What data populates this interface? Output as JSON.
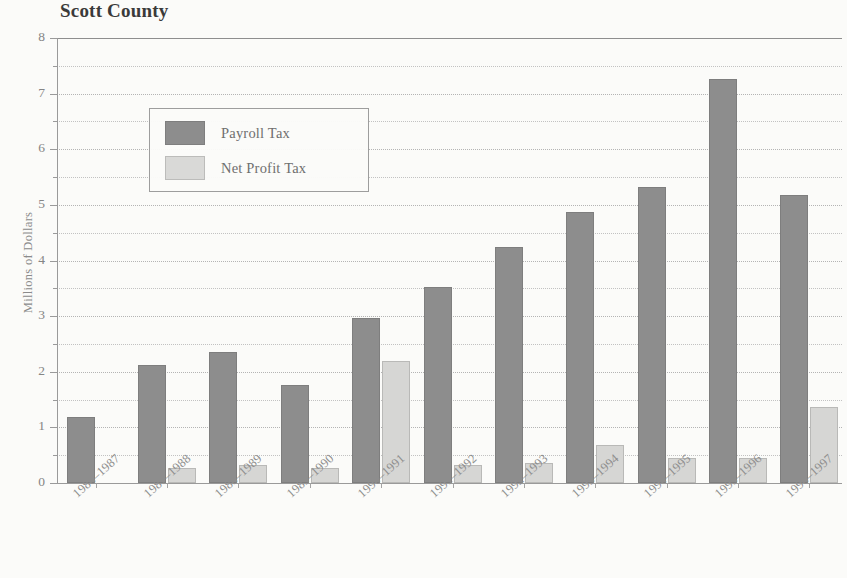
{
  "chart_data": {
    "type": "bar",
    "title": "Scott County",
    "xlabel": "",
    "ylabel": "Millions of Dollars",
    "ylim": [
      0,
      8
    ],
    "yticks": [
      0,
      1,
      2,
      3,
      4,
      5,
      6,
      7,
      8
    ],
    "ytick_labels": [
      "0",
      "1",
      "2",
      "3",
      "4",
      "5",
      "6",
      "7",
      "8"
    ],
    "minor_tick_interval": 0.5,
    "grid": true,
    "grid_axis": "y",
    "legend_position": "upper left",
    "categories": [
      "1986–1987",
      "1987–1988",
      "1988–1989",
      "1989–1990",
      "1990–1991",
      "1991–1992",
      "1992–1993",
      "1993–1994",
      "1994–1995",
      "1995–1996",
      "1996–1997"
    ],
    "series": [
      {
        "name": "Payroll Tax",
        "color": "#8d8d8d",
        "values": [
          1.18,
          2.12,
          2.35,
          1.77,
          2.97,
          3.53,
          4.25,
          4.87,
          5.32,
          7.27,
          5.18
        ]
      },
      {
        "name": "Net Profit Tax",
        "color": "#d6d6d4",
        "values": [
          0.0,
          0.27,
          0.33,
          0.27,
          2.19,
          0.32,
          0.36,
          0.68,
          0.45,
          0.45,
          1.37
        ]
      }
    ]
  },
  "legend": {
    "items": [
      {
        "label": "Payroll Tax"
      },
      {
        "label": "Net Profit Tax"
      }
    ]
  }
}
